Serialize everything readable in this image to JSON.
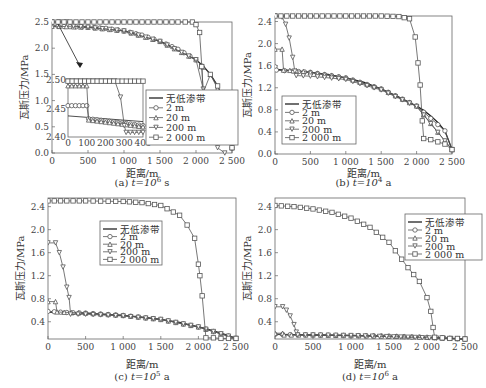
{
  "figure": {
    "panels": [
      {
        "id": "a",
        "caption": "(a) t=10⁶ s",
        "caption_prefix": "(a) ",
        "caption_t": "t=10",
        "caption_exp": "6",
        "caption_unit": " s"
      },
      {
        "id": "b",
        "caption": "(b) t=10⁴ a",
        "caption_prefix": "(b) ",
        "caption_t": "t=10",
        "caption_exp": "4",
        "caption_unit": " a"
      },
      {
        "id": "c",
        "caption": "(c) t=10⁵ a",
        "caption_prefix": "(c) ",
        "caption_t": "t=10",
        "caption_exp": "5",
        "caption_unit": " a"
      },
      {
        "id": "d",
        "caption": "(d) t=10⁶ a",
        "caption_prefix": "(d) ",
        "caption_t": "t=10",
        "caption_exp": "6",
        "caption_unit": " a"
      }
    ],
    "xlabel": "距离/m",
    "ylabel": "瓦斯压力/MPa",
    "legend": [
      "无低渗带",
      "2 m",
      "20 m",
      "200 m",
      "2 000 m"
    ]
  },
  "chart_data": [
    {
      "type": "line",
      "title": "(a) t=10^6 s",
      "xlabel": "距离/m",
      "ylabel": "瓦斯压力/MPa",
      "xlim": [
        0,
        2500
      ],
      "ylim": [
        0,
        2.5
      ],
      "xticks": [
        "0",
        "500",
        "1 000",
        "1 500",
        "2 000",
        "2 500"
      ],
      "yticks": [
        "0.0",
        "0.5",
        "1.0",
        "1.5",
        "2.0",
        "2.5"
      ],
      "legend_position": "lower right inside",
      "series": [
        {
          "name": "无低渗带",
          "marker": "none",
          "x": [
            0,
            250,
            500,
            750,
            1000,
            1250,
            1500,
            1750,
            2000,
            2100,
            2200,
            2300,
            2400,
            2500
          ],
          "y": [
            2.42,
            2.41,
            2.4,
            2.38,
            2.33,
            2.25,
            2.13,
            1.98,
            1.78,
            1.66,
            1.5,
            1.28,
            0.95,
            0.1
          ]
        },
        {
          "name": "2 m",
          "marker": "circle",
          "x": [
            0,
            250,
            500,
            750,
            1000,
            1250,
            1500,
            1750,
            2000,
            2080,
            2100,
            2200,
            2300,
            2400,
            2500
          ],
          "y": [
            2.42,
            2.41,
            2.4,
            2.38,
            2.33,
            2.25,
            2.13,
            1.98,
            1.78,
            1.66,
            1.15,
            1.1,
            0.95,
            0.7,
            0.1
          ]
        },
        {
          "name": "20 m",
          "marker": "triangle-up",
          "x": [
            0,
            500,
            1000,
            1500,
            2000,
            2200,
            2400,
            2500
          ],
          "y": [
            2.42,
            2.4,
            2.33,
            2.13,
            1.78,
            1.5,
            0.95,
            0.1
          ]
        },
        {
          "name": "200 m",
          "marker": "triangle-down",
          "x": [
            0,
            200,
            300,
            500,
            1000,
            1500,
            2000,
            2300,
            2400
          ],
          "y": [
            2.5,
            2.5,
            2.42,
            2.4,
            2.33,
            2.13,
            1.78,
            0.1,
            0.0
          ]
        },
        {
          "name": "2 000 m",
          "marker": "square",
          "x": [
            0,
            250,
            500,
            750,
            1000,
            1250,
            1500,
            1750,
            1950,
            2000,
            2050,
            2080,
            2100,
            2200,
            2300,
            2400,
            2500
          ],
          "y": [
            2.5,
            2.5,
            2.5,
            2.5,
            2.5,
            2.5,
            2.5,
            2.5,
            2.5,
            2.45,
            2.3,
            1.65,
            1.15,
            1.5,
            1.28,
            0.95,
            0.1
          ]
        }
      ],
      "inset": {
        "xlim": [
          0,
          400
        ],
        "ylim": [
          2.4,
          2.5
        ],
        "xticks": [
          "0",
          "100",
          "200",
          "300",
          "400"
        ],
        "yticks": [
          "2.40",
          "2.45",
          "2.50"
        ],
        "series": [
          {
            "name": "无低渗带",
            "x": [
              0,
              400
            ],
            "y": [
              2.437,
              2.427
            ]
          },
          {
            "name": "2 m",
            "x": [
              0,
              100,
              110,
              400
            ],
            "y": [
              2.455,
              2.455,
              2.432,
              2.42
            ]
          },
          {
            "name": "20 m",
            "x": [
              0,
              100,
              110,
              400
            ],
            "y": [
              2.49,
              2.49,
              2.43,
              2.418
            ]
          },
          {
            "name": "200 m",
            "x": [
              0,
              250,
              280,
              300,
              310,
              400
            ],
            "y": [
              2.498,
              2.498,
              2.47,
              2.42,
              2.408,
              2.408
            ]
          },
          {
            "name": "2 000 m",
            "x": [
              0,
              400
            ],
            "y": [
              2.498,
              2.498
            ]
          }
        ]
      }
    },
    {
      "type": "line",
      "title": "(b) t=10^4 a",
      "xlabel": "距离/m",
      "ylabel": "瓦斯压力/MPa",
      "xlim": [
        0,
        2500
      ],
      "ylim": [
        0,
        2.5
      ],
      "xticks": [
        "0",
        "500",
        "1 000",
        "1 500",
        "2 000",
        "2 500"
      ],
      "yticks": [
        "0.0",
        "0.4",
        "0.8",
        "1.2",
        "1.6",
        "2.0",
        "2.4"
      ],
      "legend_position": "lower left inside",
      "series": [
        {
          "name": "无低渗带",
          "marker": "none",
          "x": [
            0,
            250,
            500,
            750,
            1000,
            1250,
            1500,
            1750,
            2000,
            2100,
            2200,
            2300,
            2400,
            2500
          ],
          "y": [
            1.53,
            1.51,
            1.48,
            1.44,
            1.38,
            1.3,
            1.18,
            1.03,
            0.87,
            0.79,
            0.69,
            0.57,
            0.42,
            0.08
          ]
        },
        {
          "name": "2 m",
          "marker": "circle",
          "x": [
            0,
            20,
            250,
            500,
            1000,
            1500,
            2000,
            2400,
            2500
          ],
          "y": [
            1.58,
            1.52,
            1.5,
            1.48,
            1.38,
            1.18,
            0.87,
            0.42,
            0.08
          ]
        },
        {
          "name": "20 m",
          "marker": "triangle-up",
          "x": [
            0,
            100,
            120,
            300,
            500,
            1000,
            1500,
            2000,
            2500
          ],
          "y": [
            1.9,
            1.9,
            1.52,
            1.51,
            1.48,
            1.38,
            1.18,
            0.87,
            0.08
          ]
        },
        {
          "name": "200 m",
          "marker": "triangle-down",
          "x": [
            0,
            100,
            150,
            200,
            250,
            280,
            300,
            500,
            1000,
            1500,
            2000,
            2500
          ],
          "y": [
            2.5,
            2.48,
            2.35,
            2.1,
            1.75,
            1.5,
            1.42,
            1.41,
            1.35,
            1.16,
            0.86,
            0.08
          ]
        },
        {
          "name": "2 000 m",
          "marker": "square",
          "x": [
            0,
            250,
            500,
            750,
            1000,
            1250,
            1500,
            1750,
            1900,
            1980,
            2020,
            2050,
            2080,
            2100,
            2200,
            2300,
            2400,
            2500
          ],
          "y": [
            2.5,
            2.5,
            2.5,
            2.5,
            2.5,
            2.5,
            2.5,
            2.49,
            2.45,
            2.12,
            1.65,
            1.25,
            0.6,
            0.28,
            0.26,
            0.22,
            0.18,
            0.08
          ]
        }
      ]
    },
    {
      "type": "line",
      "title": "(c) t=10^5 a",
      "xlabel": "距离/m",
      "ylabel": "瓦斯压力/MPa",
      "xlim": [
        0,
        2500
      ],
      "ylim": [
        0.1,
        2.55
      ],
      "xticks": [
        "0",
        "500",
        "1 000",
        "1 500",
        "2 000",
        "2 500"
      ],
      "yticks": [
        "0.4",
        "0.8",
        "1.2",
        "1.6",
        "2.0",
        "2.4"
      ],
      "legend_position": "upper center inside",
      "series": [
        {
          "name": "无低渗带",
          "marker": "none",
          "x": [
            0,
            250,
            500,
            750,
            1000,
            1250,
            1500,
            1750,
            2000,
            2100,
            2200,
            2300,
            2400,
            2500
          ],
          "y": [
            0.57,
            0.56,
            0.55,
            0.53,
            0.51,
            0.48,
            0.44,
            0.39,
            0.31,
            0.28,
            0.24,
            0.2,
            0.16,
            0.11
          ]
        },
        {
          "name": "2 m",
          "marker": "circle",
          "x": [
            0,
            250,
            500,
            1000,
            1500,
            2000,
            2500
          ],
          "y": [
            0.58,
            0.56,
            0.55,
            0.51,
            0.44,
            0.31,
            0.11
          ]
        },
        {
          "name": "20 m",
          "marker": "triangle-up",
          "x": [
            0,
            100,
            120,
            500,
            1000,
            1500,
            2000,
            2500
          ],
          "y": [
            0.75,
            0.75,
            0.57,
            0.55,
            0.51,
            0.44,
            0.31,
            0.11
          ]
        },
        {
          "name": "200 m",
          "marker": "triangle-down",
          "x": [
            0,
            100,
            150,
            200,
            250,
            280,
            300,
            500,
            1000,
            1500,
            2000,
            2500
          ],
          "y": [
            1.77,
            1.77,
            1.6,
            1.35,
            1.0,
            0.82,
            0.53,
            0.53,
            0.5,
            0.44,
            0.31,
            0.11
          ]
        },
        {
          "name": "2 000 m",
          "marker": "square",
          "x": [
            0,
            250,
            500,
            1000,
            1250,
            1500,
            1750,
            1850,
            1950,
            2000,
            2020,
            2050,
            2100,
            2200,
            2300,
            2400,
            2500
          ],
          "y": [
            2.5,
            2.5,
            2.5,
            2.49,
            2.47,
            2.42,
            2.25,
            2.08,
            1.85,
            1.4,
            1.2,
            0.85,
            0.12,
            0.12,
            0.11,
            0.11,
            0.11
          ]
        }
      ]
    },
    {
      "type": "line",
      "title": "(d) t=10^6 a",
      "xlabel": "距离/m",
      "ylabel": "瓦斯压力/MPa",
      "xlim": [
        0,
        2500
      ],
      "ylim": [
        0.1,
        2.55
      ],
      "xticks": [
        "0",
        "500",
        "1 000",
        "1 500",
        "2 000",
        "2 500"
      ],
      "yticks": [
        "0.4",
        "0.8",
        "1.2",
        "1.6",
        "2.0",
        "2.4"
      ],
      "legend_position": "upper right inside",
      "series": [
        {
          "name": "无低渗带",
          "marker": "none",
          "x": [
            0,
            500,
            1000,
            1500,
            2000,
            2500
          ],
          "y": [
            0.18,
            0.17,
            0.16,
            0.15,
            0.13,
            0.1
          ]
        },
        {
          "name": "2 m",
          "marker": "circle",
          "x": [
            0,
            500,
            1000,
            1500,
            2000,
            2500
          ],
          "y": [
            0.18,
            0.17,
            0.16,
            0.15,
            0.13,
            0.1
          ]
        },
        {
          "name": "20 m",
          "marker": "triangle-up",
          "x": [
            0,
            100,
            120,
            500,
            1000,
            1500,
            2000,
            2500
          ],
          "y": [
            0.2,
            0.2,
            0.17,
            0.17,
            0.16,
            0.15,
            0.13,
            0.1
          ]
        },
        {
          "name": "200 m",
          "marker": "triangle-down",
          "x": [
            0,
            100,
            150,
            200,
            250,
            280,
            300,
            500,
            1000,
            2500
          ],
          "y": [
            0.66,
            0.66,
            0.6,
            0.5,
            0.35,
            0.22,
            0.17,
            0.17,
            0.16,
            0.1
          ]
        },
        {
          "name": "2 000 m",
          "marker": "square",
          "x": [
            0,
            250,
            500,
            750,
            1000,
            1250,
            1500,
            1750,
            1900,
            2000,
            2050,
            2080,
            2100,
            2200,
            2300,
            2400,
            2500
          ],
          "y": [
            2.42,
            2.4,
            2.36,
            2.3,
            2.2,
            2.04,
            1.78,
            1.34,
            1.1,
            0.82,
            0.58,
            0.3,
            0.13,
            0.12,
            0.11,
            0.11,
            0.1
          ]
        }
      ]
    }
  ]
}
